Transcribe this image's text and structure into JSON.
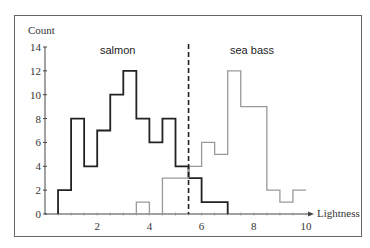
{
  "chart_data": {
    "type": "histogram",
    "title": "",
    "xlabel": "Lightness",
    "ylabel": "Count",
    "xlim": [
      0,
      10
    ],
    "ylim": [
      0,
      14
    ],
    "xticks": [
      2,
      4,
      6,
      8,
      10
    ],
    "yticks": [
      0,
      2,
      4,
      6,
      8,
      10,
      12,
      14
    ],
    "bin_width": 0.5,
    "grid": false,
    "legend": "inline labels",
    "decision_threshold": {
      "x": 5.5,
      "style": "dashed",
      "color": "#222222"
    },
    "series": [
      {
        "name": "salmon",
        "color": "#222222",
        "bins_start": [
          0.5,
          1.0,
          1.5,
          2.0,
          2.5,
          3.0,
          3.5,
          4.0,
          4.5,
          5.0,
          5.5,
          6.0,
          6.5
        ],
        "values": [
          2,
          8,
          4,
          7,
          10,
          12,
          8,
          6,
          8,
          4,
          3,
          1,
          1
        ]
      },
      {
        "name": "sea bass",
        "color": "#999999",
        "bins_start": [
          3.5,
          4.0,
          4.5,
          5.0,
          5.5,
          6.0,
          6.5,
          7.0,
          7.5,
          8.0,
          8.5,
          9.0,
          9.5
        ],
        "values": [
          1,
          0,
          3,
          3,
          4,
          6,
          5,
          12,
          9,
          9,
          2,
          1,
          2
        ]
      }
    ]
  },
  "labels": {
    "y_axis_title": "Count",
    "x_axis_title": "Lightness",
    "salmon": "salmon",
    "sea_bass": "sea bass",
    "y_ticks": [
      "0",
      "2",
      "4",
      "6",
      "8",
      "10",
      "12",
      "14"
    ],
    "x_ticks": [
      "2",
      "4",
      "6",
      "8",
      "10"
    ]
  }
}
